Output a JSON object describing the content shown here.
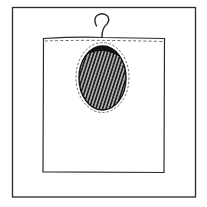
{
  "illustration": {
    "subject": "hanging bag with oval window",
    "colors": {
      "background": "#ffffff",
      "line": "#2a2a2a",
      "window_fill": "#1e1e1e",
      "hatch": "#f2f2f2"
    },
    "parts": {
      "frame": "outer-frame",
      "bag": "bag-body",
      "hook": "hanger-hook",
      "window": "oval-window",
      "stitching": "dashed-seam"
    }
  }
}
